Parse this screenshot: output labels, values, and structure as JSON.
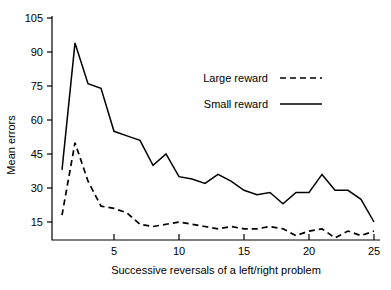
{
  "chart_data": {
    "type": "line",
    "title": "",
    "xlabel": "Successive reversals of a left/right problem",
    "ylabel": "Mean errors",
    "x": [
      1,
      2,
      3,
      4,
      5,
      6,
      7,
      8,
      9,
      10,
      11,
      12,
      13,
      14,
      15,
      16,
      17,
      18,
      19,
      20,
      21,
      22,
      23,
      24,
      25
    ],
    "xlim": [
      1,
      25
    ],
    "ylim": [
      0,
      105
    ],
    "xticks": [
      5,
      10,
      15,
      20,
      25
    ],
    "xtick_labels": [
      "5",
      "10",
      "15",
      "20",
      "25"
    ],
    "yticks": [
      15,
      30,
      45,
      60,
      75,
      90,
      105
    ],
    "ytick_labels": [
      "15",
      "30",
      "45",
      "60",
      "75",
      "90",
      "105"
    ],
    "grid": false,
    "legend_position": "upper-right-inside",
    "series": [
      {
        "name": "Large reward",
        "style": "dashed",
        "color": "#000000",
        "values": [
          18,
          50,
          33,
          22,
          21,
          19,
          14,
          13,
          14,
          15,
          14,
          13,
          12,
          13,
          12,
          12,
          13,
          12,
          9,
          11,
          12,
          8,
          11,
          9,
          11
        ]
      },
      {
        "name": "Small reward",
        "style": "solid",
        "color": "#000000",
        "values": [
          38,
          94,
          76,
          74,
          55,
          53,
          51,
          40,
          45,
          35,
          34,
          32,
          36,
          33,
          29,
          27,
          28,
          23,
          28,
          28,
          36,
          29,
          29,
          25,
          15
        ]
      }
    ]
  },
  "legend": {
    "items": [
      {
        "label": "Large reward",
        "style": "dashed"
      },
      {
        "label": "Small reward",
        "style": "solid"
      }
    ]
  },
  "axes": {
    "y_title": "Mean errors",
    "x_title": "Successive reversals of a left/right problem"
  }
}
